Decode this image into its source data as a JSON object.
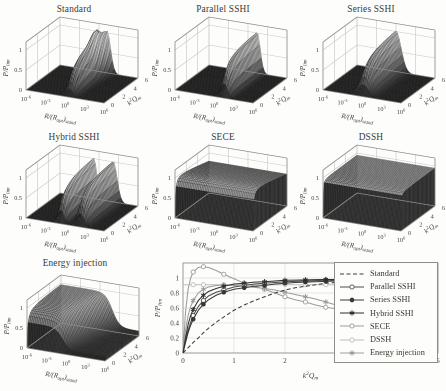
{
  "figure": {
    "bg": "#fdfdfb",
    "text_color": "#3f3f37",
    "grid3d_color": "#c6c6c1",
    "box3d_color": "#8f8f8a",
    "surface_mesh_color": "rgba(15,15,15,0.5)"
  },
  "chart_data": [
    {
      "id": "standard",
      "type": "surface3d",
      "title": "Standard",
      "xlabel": "R/(R_{opt})_{stand}",
      "ylabel": "k^{2}Q_{m}",
      "zlabel": "P/P_{lim}",
      "xticks": [
        "10^{-6}",
        "10^{-3}",
        "10^{0}",
        "10^{3}",
        "10^{6}"
      ],
      "yticks": [
        "0",
        "2",
        "4",
        "6"
      ],
      "zticks": [
        "0",
        "0.5",
        "1"
      ],
      "xrange_log10": [
        -6,
        6
      ],
      "yrange": [
        0,
        6
      ],
      "zrange": [
        0,
        1.2
      ],
      "shape_note": "single ridge near optimal R splitting into twin peaks at high k2Qm, max ~1",
      "surface": {
        "kind": "ridge",
        "satA": 1.1,
        "amp": 1.25,
        "peaks": [
          {
            "c": 0.5,
            "s": 0.55,
            "splitMax": 0.75,
            "splitFrom": 3
          }
        ]
      }
    },
    {
      "id": "parallel-sshi",
      "type": "surface3d",
      "title": "Parallel SSHI",
      "xlabel": "R/(R_{opt})_{stand}",
      "ylabel": "k^{2}Q_{m}",
      "zlabel": "P/P_{lim}",
      "xticks": [
        "10^{-6}",
        "10^{-3}",
        "10^{0}",
        "10^{3}",
        "10^{6}"
      ],
      "yticks": [
        "0",
        "2",
        "4",
        "6"
      ],
      "zticks": [
        "0",
        "0.5",
        "1"
      ],
      "xrange_log10": [
        -6,
        6
      ],
      "yrange": [
        0,
        6
      ],
      "zrange": [
        0,
        1.2
      ],
      "shape_note": "narrow tall ridge around R/(R_opt)_stand ~ 10^1, max ~1",
      "surface": {
        "kind": "ridge",
        "satA": 0.45,
        "amp": 1.1,
        "peaks": [
          {
            "c": 1.4,
            "s": 0.5
          }
        ]
      }
    },
    {
      "id": "series-sshi",
      "type": "surface3d",
      "title": "Series SSHI",
      "xlabel": "R/(R_{opt})_{stand}",
      "ylabel": "k^{2}Q_{m}",
      "zlabel": "P/P_{lim}",
      "xticks": [
        "10^{-6}",
        "10^{-3}",
        "10^{0}",
        "10^{3}",
        "10^{6}"
      ],
      "yticks": [
        "0",
        "2",
        "4",
        "6"
      ],
      "zticks": [
        "0",
        "0.5",
        "1"
      ],
      "xrange_log10": [
        -6,
        6
      ],
      "yrange": [
        0,
        6
      ],
      "zrange": [
        0,
        1.2
      ],
      "shape_note": "broad triangular ridge around R/(R_opt)_stand ~ 1, max ~1",
      "surface": {
        "kind": "ridge",
        "satA": 0.6,
        "amp": 1.12,
        "peaks": [
          {
            "c": 0.0,
            "s": 0.8
          }
        ]
      }
    },
    {
      "id": "hybrid-sshi",
      "type": "surface3d",
      "title": "Hybrid SSHI",
      "xlabel": "R/(R_{opt})_{stand}",
      "ylabel": "k^{2}Q_{m}",
      "zlabel": "P/P_{lim}",
      "xticks": [
        "10^{-6}",
        "10^{-3}",
        "10^{0}",
        "10^{3}",
        "10^{6}"
      ],
      "yticks": [
        "0",
        "2",
        "4",
        "6"
      ],
      "zticks": [
        "0",
        "0.5",
        "1"
      ],
      "xrange_log10": [
        -6,
        6
      ],
      "yrange": [
        0,
        6
      ],
      "zrange": [
        0,
        1.2
      ],
      "shape_note": "two separate ridges (low-R and high-R optima) with deep valley between, max ~1",
      "surface": {
        "kind": "ridge",
        "satA": 0.5,
        "amp": 1.1,
        "peaks": [
          {
            "c": -0.8,
            "s": 0.5
          },
          {
            "c": 2.2,
            "s": 0.6
          }
        ]
      }
    },
    {
      "id": "sece",
      "type": "surface3d",
      "title": "SECE",
      "xlabel": "R/(R_{opt})_{stand}",
      "ylabel": "k^{2}Q_{m}",
      "zlabel": "P/P_{lim}",
      "xticks": [
        "10^{-6}",
        "10^{-3}",
        "10^{0}",
        "10^{3}",
        "10^{6}"
      ],
      "yticks": [
        "0",
        "2",
        "4",
        "6"
      ],
      "zticks": [
        "0",
        "0.5",
        "1"
      ],
      "xrange_log10": [
        -6,
        6
      ],
      "yrange": [
        0,
        6
      ],
      "zrange": [
        0,
        1.2
      ],
      "shape_note": "load-independent plateau near 1, slightly sagging at high k2Qm",
      "surface": {
        "kind": "plateau",
        "satA": 0.08,
        "b0": 1.08,
        "b1": -0.045
      }
    },
    {
      "id": "dssh",
      "type": "surface3d",
      "title": "DSSH",
      "xlabel": "R/(R_{opt})_{stand}",
      "ylabel": "k^{2}Q_{m}",
      "zlabel": "P/P_{lim}",
      "xticks": [
        "10^{-6}",
        "10^{-3}",
        "10^{0}",
        "10^{3}",
        "10^{6}"
      ],
      "yticks": [
        "0",
        "2",
        "4",
        "6"
      ],
      "zticks": [
        "0",
        "0.5",
        "1"
      ],
      "xrange_log10": [
        -6,
        6
      ],
      "yrange": [
        0,
        6
      ],
      "zrange": [
        0,
        1.2
      ],
      "shape_note": "completely flat slab at ~0.95 independent of R and k2Qm",
      "surface": {
        "kind": "plateau",
        "satA": 0.02,
        "b0": 0.95,
        "b1": 0
      }
    },
    {
      "id": "energy-injection",
      "type": "surface3d",
      "title": "Energy injection",
      "xlabel": "R/(R_{opt})_{stand}",
      "ylabel": "k^{2}Q_{m}",
      "zlabel": "P/P_{lim}",
      "xticks": [
        "10^{-6}",
        "10^{-3}",
        "10^{0}",
        "10^{3}",
        "10^{6}"
      ],
      "yticks": [
        "0",
        "2",
        "4",
        "6"
      ],
      "zticks": [
        "0",
        "0.5",
        "1"
      ],
      "xrange_log10": [
        -6,
        6
      ],
      "yrange": [
        0,
        6
      ],
      "zrange": [
        0,
        1.2
      ],
      "shape_note": "high plateau ~1 at low R dropping with a curved cliff to ~0.12 at high R",
      "surface": {
        "kind": "step",
        "satA": 0.12,
        "top": 0.98,
        "low": 0.13,
        "ucBase": -0.8,
        "ucSlope": 0.45,
        "width": 0.55
      }
    },
    {
      "id": "comparison",
      "type": "line",
      "title": "",
      "xlabel": "k^{2}Q_{m}",
      "ylabel": "P/P_{lim}",
      "xlim": [
        0,
        5
      ],
      "ylim": [
        0,
        1.2
      ],
      "xticks": [
        0,
        1,
        2,
        3,
        4,
        5
      ],
      "yticks": [
        0,
        0.2,
        0.4,
        0.6,
        0.8,
        1
      ],
      "grid": true,
      "legend_position": "right-inside",
      "x": [
        0,
        0.05,
        0.1,
        0.15,
        0.2,
        0.3,
        0.4,
        0.5,
        0.65,
        0.8,
        1,
        1.2,
        1.4,
        1.6,
        1.8,
        2,
        2.2,
        2.4,
        2.6,
        2.8,
        3,
        3.15,
        3.3
      ],
      "series": [
        {
          "id": "standard",
          "name": "Standard",
          "color": "#3c3c3c",
          "dash": [
            4,
            2.5
          ],
          "marker": "none",
          "values": [
            0,
            0.035,
            0.07,
            0.105,
            0.14,
            0.2,
            0.27,
            0.33,
            0.41,
            0.48,
            0.57,
            0.64,
            0.7,
            0.75,
            0.8,
            0.84,
            0.87,
            0.89,
            0.91,
            0.93,
            0.94,
            0.945,
            0.95
          ]
        },
        {
          "id": "parallel-sshi",
          "name": "Parallel SSHI",
          "color": "#4b4b4b",
          "dash": [],
          "marker": "o",
          "values": [
            0,
            0.16,
            0.3,
            0.41,
            0.5,
            0.62,
            0.7,
            0.76,
            0.81,
            0.84,
            0.88,
            0.9,
            0.92,
            0.93,
            0.94,
            0.95,
            0.955,
            0.96,
            0.965,
            0.97,
            0.97,
            0.97,
            0.97
          ]
        },
        {
          "id": "series-sshi",
          "name": "Series SSHI",
          "color": "#383838",
          "dash": [],
          "marker": "dot",
          "values": [
            0,
            0.14,
            0.27,
            0.37,
            0.45,
            0.57,
            0.65,
            0.71,
            0.77,
            0.81,
            0.85,
            0.87,
            0.89,
            0.9,
            0.92,
            0.93,
            0.94,
            0.945,
            0.95,
            0.955,
            0.96,
            0.96,
            0.96
          ]
        },
        {
          "id": "hybrid-sshi",
          "name": "Hybrid SSHI",
          "color": "#2f2f2f",
          "dash": [],
          "marker": "star",
          "values": [
            0,
            0.2,
            0.38,
            0.5,
            0.58,
            0.7,
            0.77,
            0.82,
            0.86,
            0.89,
            0.92,
            0.93,
            0.945,
            0.95,
            0.96,
            0.97,
            0.972,
            0.975,
            0.978,
            0.98,
            0.98,
            0.98,
            0.98
          ]
        },
        {
          "id": "sece",
          "name": "SECE",
          "color": "#9c9c96",
          "dash": [],
          "marker": "o",
          "values": [
            0,
            0.55,
            0.85,
            1.0,
            1.08,
            1.14,
            1.15,
            1.14,
            1.1,
            1.05,
            0.99,
            0.93,
            0.89,
            0.85,
            0.8,
            0.75,
            0.71,
            0.68,
            0.64,
            0.61,
            0.59,
            0.57,
            0.55
          ]
        },
        {
          "id": "dssh",
          "name": "DSSH",
          "color": "#bdbdb6",
          "dash": [],
          "marker": "o",
          "values": [
            0.91,
            0.91,
            0.91,
            0.91,
            0.91,
            0.91,
            0.91,
            0.91,
            0.91,
            0.91,
            0.91,
            0.91,
            0.91,
            0.91,
            0.91,
            0.91,
            0.91,
            0.91,
            0.91,
            0.91,
            0.91,
            0.91,
            0.91
          ]
        },
        {
          "id": "energy-injection",
          "name": "Energy injection",
          "color": "#9c9c96",
          "dash": [],
          "marker": "star",
          "values": [
            0,
            0.3,
            0.5,
            0.62,
            0.7,
            0.8,
            0.85,
            0.88,
            0.9,
            0.905,
            0.9,
            0.89,
            0.875,
            0.86,
            0.84,
            0.81,
            0.78,
            0.75,
            0.72,
            0.68,
            0.64,
            0.61,
            0.58
          ]
        }
      ]
    }
  ]
}
